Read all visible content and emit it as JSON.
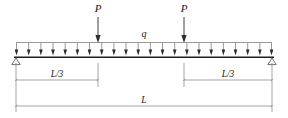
{
  "diagram": {
    "type": "structural-beam-free-body-diagram",
    "colors": {
      "line": "#2b2b2b",
      "beam": "#1f1f1f",
      "dimension": "#6a6a6a",
      "background": "#ffffff",
      "text": "#1a1a1a"
    },
    "beam": {
      "left_x": 14,
      "right_x": 274,
      "y": 57,
      "span_label": "L"
    },
    "point_loads": [
      {
        "label": "P",
        "x": 98,
        "label_x": 98,
        "label_y": 11,
        "arrow_top_y": 16,
        "arrow_bottom_y": 42
      },
      {
        "label": "P",
        "x": 184,
        "label_x": 184,
        "label_y": 11,
        "arrow_top_y": 16,
        "arrow_bottom_y": 42
      }
    ],
    "distributed_load": {
      "label": "q",
      "label_x": 144,
      "label_y": 36,
      "top_line_y": 42,
      "bottom_y": 55,
      "left_x": 16,
      "right_x": 272,
      "arrow_count": 22
    },
    "supports": [
      {
        "name": "pin-support-left",
        "x": 16,
        "y": 57,
        "type": "triangle"
      },
      {
        "name": "roller-support-right",
        "x": 272,
        "y": 57,
        "type": "triangle"
      }
    ],
    "dimensions": [
      {
        "name": "dimension-left-third",
        "label": "L/3",
        "start_x": 16,
        "end_x": 98,
        "y": 80,
        "label_x": 57,
        "label_y": 76
      },
      {
        "name": "dimension-right-third",
        "label": "L/3",
        "start_x": 184,
        "end_x": 272,
        "y": 80,
        "label_x": 228,
        "label_y": 76
      },
      {
        "name": "dimension-total-span",
        "label": "L",
        "start_x": 16,
        "end_x": 272,
        "y": 106,
        "label_x": 144,
        "label_y": 102
      }
    ],
    "extension_lines": [
      {
        "x": 16,
        "y1": 62,
        "y2": 110
      },
      {
        "x": 98,
        "y1": 62,
        "y2": 86
      },
      {
        "x": 184,
        "y1": 62,
        "y2": 86
      },
      {
        "x": 272,
        "y1": 62,
        "y2": 110
      }
    ]
  }
}
